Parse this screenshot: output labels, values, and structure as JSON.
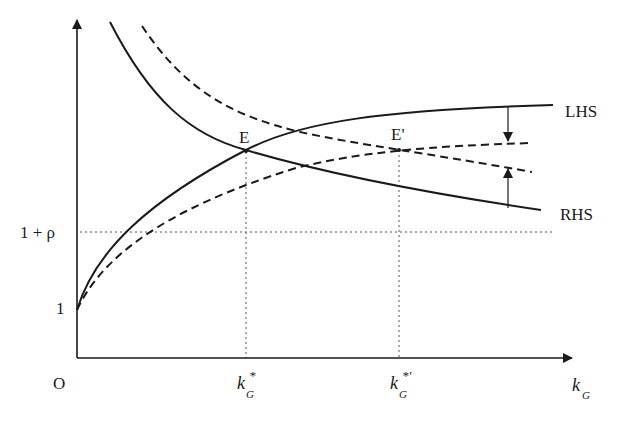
{
  "diagram": {
    "axes": {
      "origin_label": "O",
      "x_label": "k",
      "x_label_sub": "G",
      "y_tick_1": "1",
      "y_tick_rho": "1 + ρ"
    },
    "x_ticks": [
      {
        "base": "k",
        "sup": "*",
        "sub": "G"
      },
      {
        "base": "k",
        "sup": "*'",
        "sub": "G"
      }
    ],
    "points": {
      "E": "E",
      "E_prime": "E'"
    },
    "curve_labels": {
      "lhs": "LHS",
      "rhs": "RHS"
    },
    "colors": {
      "line": "#1a1a1a",
      "guide": "#555555",
      "background": "#ffffff"
    }
  }
}
